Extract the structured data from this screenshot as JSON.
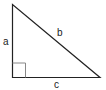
{
  "diagram": {
    "type": "right-triangle",
    "labels": {
      "side_a": "a",
      "side_b": "b",
      "side_c": "c"
    },
    "colors": {
      "stroke": "#222222",
      "right_angle_marker": "#888888",
      "background": "#ffffff"
    }
  }
}
